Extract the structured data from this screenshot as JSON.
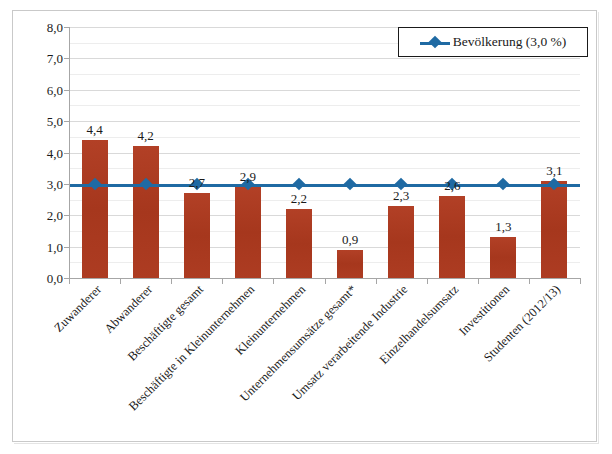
{
  "chart_data": {
    "type": "bar",
    "title": "",
    "subtitle": "",
    "xlabel": "",
    "ylabel": "",
    "ylim": [
      0,
      8
    ],
    "ytick_step": 1,
    "yminor_step": 0.5,
    "grid": true,
    "legend_position": "top-right",
    "categories": [
      "Zuwanderer",
      "Abwanderer",
      "Beschäftigte gesamt",
      "Beschäftigte in Kleinunternehmen",
      "Kleinunternehmen",
      "Unternehmensumsätze gesamt*",
      "Umsatz verarbeitende Industrie",
      "Einzelhandelsumsatz",
      "Investitionen",
      "Studenten (2012/13)"
    ],
    "values": [
      4.4,
      4.2,
      2.7,
      2.9,
      2.2,
      0.9,
      2.3,
      2.6,
      1.3,
      3.1
    ],
    "value_labels": [
      "4,4",
      "4,2",
      "2,7",
      "2,9",
      "2,2",
      "0,9",
      "2,3",
      "2,6",
      "1,3",
      "3,1"
    ],
    "ytick_labels": [
      "0,0",
      "1,0",
      "2,0",
      "3,0",
      "4,0",
      "5,0",
      "6,0",
      "7,0",
      "8,0"
    ],
    "ytick_values": [
      0,
      1,
      2,
      3,
      4,
      5,
      6,
      7,
      8
    ],
    "series": [
      {
        "name": "Anteil",
        "type": "bar",
        "color": "#aa3a20",
        "values": [
          4.4,
          4.2,
          2.7,
          2.9,
          2.2,
          0.9,
          2.3,
          2.6,
          1.3,
          3.1
        ]
      },
      {
        "name": "Bevölkerung (3,0 %)",
        "type": "line",
        "color": "#1f6aa3",
        "constant": 3.0,
        "values": [
          3.0,
          3.0,
          3.0,
          3.0,
          3.0,
          3.0,
          3.0,
          3.0,
          3.0,
          3.0
        ]
      }
    ],
    "annotations": []
  },
  "legend": {
    "entries": [
      {
        "label": "Bevölkerung (3,0 %)",
        "color": "#1f6aa3",
        "marker": "diamond"
      }
    ]
  },
  "colors": {
    "bar": "#aa3a20",
    "line": "#1f6aa3",
    "grid_major": "#d9d9d9",
    "grid_minor": "#ededed",
    "axis": "#a6a6a6",
    "frame": "#c9c9c9",
    "text": "#1a1a1a",
    "background": "#ffffff"
  }
}
